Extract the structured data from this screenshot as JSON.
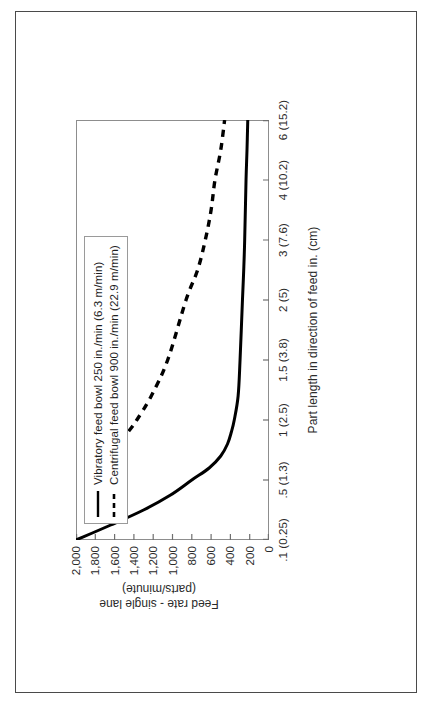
{
  "chart_data": {
    "type": "line",
    "title": "",
    "xlabel": "Part length in direction of feed in. (cm)",
    "ylabel": "Feed rate - single lane (parts/minute)",
    "ylabel_line1": "Feed rate - single lane",
    "ylabel_line2": "(parts/minute)",
    "x_tick_labels": [
      ".1 (0.25)",
      ".5 (1.3)",
      "1 (2.5)",
      "1.5 (3.8)",
      "2 (5)",
      "3 (7.6)",
      "4 (10.2)",
      "6 (15.2)"
    ],
    "x_tick_values": [
      0.1,
      0.5,
      1,
      1.5,
      2,
      3,
      4,
      6
    ],
    "y_tick_labels": [
      "0",
      "200",
      "400",
      "600",
      "800",
      "1,000",
      "1,200",
      "1,400",
      "1,600",
      "1,800",
      "2,000"
    ],
    "y_tick_values": [
      0,
      200,
      400,
      600,
      800,
      1000,
      1200,
      1400,
      1600,
      1800,
      2000
    ],
    "ylim": [
      0,
      2000
    ],
    "grid": false,
    "legend_position": "top-left-inside",
    "series": [
      {
        "name": "Vibratory feed bowl 250 in./min (6.3 m/min)",
        "style": "solid",
        "color": "#000000",
        "x": [
          0.1,
          0.2,
          0.3,
          0.4,
          0.5,
          0.6,
          0.7,
          0.8,
          0.9,
          1.0,
          1.2,
          1.5,
          2.0,
          2.5,
          3.0,
          4.0,
          5.0,
          6.0
        ],
        "y": [
          2000,
          1640,
          1300,
          1020,
          800,
          620,
          500,
          430,
          390,
          360,
          320,
          300,
          275,
          262,
          252,
          238,
          228,
          220
        ]
      },
      {
        "name": "Centrifugal feed bowl 900 in./min (22.9 m/min)",
        "style": "dashed",
        "color": "#000000",
        "x": [
          0.5,
          0.6,
          0.7,
          0.8,
          0.9,
          1.0,
          1.2,
          1.5,
          2.0,
          2.5,
          3.0,
          3.5,
          4.0,
          5.0,
          6.0
        ],
        "y": [
          1900,
          1780,
          1670,
          1560,
          1460,
          1370,
          1220,
          1050,
          860,
          740,
          660,
          600,
          560,
          500,
          460
        ]
      }
    ],
    "legend_entries": [
      {
        "label": "Vibratory feed bowl 250 in./min (6.3 m/min)",
        "style": "solid"
      },
      {
        "label": "Centrifugal feed bowl 900 in./min (22.9 m/min)",
        "style": "dashed"
      }
    ]
  }
}
